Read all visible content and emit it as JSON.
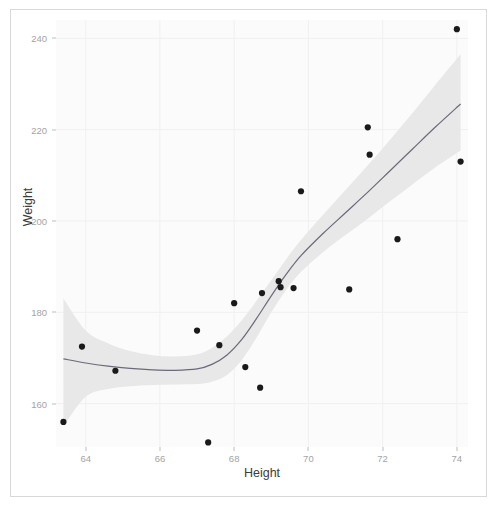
{
  "chart_data": {
    "type": "scatter",
    "title": "",
    "subtitle": "",
    "xlabel": "Height",
    "ylabel": "Weight",
    "xlim": [
      63.2,
      74.3
    ],
    "ylim": [
      150.5,
      244.0
    ],
    "xticks": [
      64,
      66,
      68,
      70,
      72,
      74
    ],
    "xticklabels": [
      "64",
      "66",
      "68",
      "70",
      "72",
      "74"
    ],
    "yticks": [
      160,
      180,
      200,
      220,
      240
    ],
    "yticklabels": [
      "160",
      "180",
      "200",
      "220",
      "240"
    ],
    "grid": true,
    "legend": false,
    "legend_position": "none",
    "points": [
      {
        "x": 63.4,
        "y": 156.0
      },
      {
        "x": 63.9,
        "y": 172.5
      },
      {
        "x": 64.8,
        "y": 167.2
      },
      {
        "x": 67.0,
        "y": 176.0
      },
      {
        "x": 67.3,
        "y": 151.5
      },
      {
        "x": 67.6,
        "y": 172.8
      },
      {
        "x": 68.0,
        "y": 182.0
      },
      {
        "x": 68.3,
        "y": 168.0
      },
      {
        "x": 68.7,
        "y": 163.5
      },
      {
        "x": 68.75,
        "y": 184.2
      },
      {
        "x": 69.2,
        "y": 186.8
      },
      {
        "x": 69.25,
        "y": 185.5
      },
      {
        "x": 69.6,
        "y": 185.3
      },
      {
        "x": 69.8,
        "y": 206.5
      },
      {
        "x": 71.1,
        "y": 185.0
      },
      {
        "x": 71.6,
        "y": 220.5
      },
      {
        "x": 71.65,
        "y": 214.5
      },
      {
        "x": 72.4,
        "y": 196.0
      },
      {
        "x": 74.0,
        "y": 242.0
      },
      {
        "x": 74.1,
        "y": 213.0
      }
    ],
    "smooth_line": {
      "name": "loess",
      "color": "#6a6a7a",
      "points": [
        {
          "x": 63.4,
          "y": 169.8
        },
        {
          "x": 64.0,
          "y": 168.9
        },
        {
          "x": 64.6,
          "y": 168.2
        },
        {
          "x": 65.2,
          "y": 167.7
        },
        {
          "x": 65.8,
          "y": 167.4
        },
        {
          "x": 66.4,
          "y": 167.3
        },
        {
          "x": 67.0,
          "y": 167.6
        },
        {
          "x": 67.4,
          "y": 168.6
        },
        {
          "x": 67.8,
          "y": 170.6
        },
        {
          "x": 68.2,
          "y": 174.0
        },
        {
          "x": 68.6,
          "y": 178.6
        },
        {
          "x": 69.0,
          "y": 183.6
        },
        {
          "x": 69.4,
          "y": 188.3
        },
        {
          "x": 69.8,
          "y": 192.4
        },
        {
          "x": 70.4,
          "y": 197.3
        },
        {
          "x": 71.0,
          "y": 201.8
        },
        {
          "x": 71.6,
          "y": 206.3
        },
        {
          "x": 72.2,
          "y": 211.0
        },
        {
          "x": 72.8,
          "y": 215.7
        },
        {
          "x": 73.4,
          "y": 220.4
        },
        {
          "x": 74.1,
          "y": 225.6
        }
      ]
    },
    "confidence_band": {
      "fill": "#e8e8e8",
      "level": 0.95,
      "upper": [
        {
          "x": 63.4,
          "y": 183.0
        },
        {
          "x": 64.0,
          "y": 176.0
        },
        {
          "x": 64.6,
          "y": 173.2
        },
        {
          "x": 65.2,
          "y": 171.5
        },
        {
          "x": 65.8,
          "y": 170.6
        },
        {
          "x": 66.4,
          "y": 170.3
        },
        {
          "x": 67.0,
          "y": 170.8
        },
        {
          "x": 67.4,
          "y": 172.2
        },
        {
          "x": 67.8,
          "y": 174.7
        },
        {
          "x": 68.2,
          "y": 178.2
        },
        {
          "x": 68.6,
          "y": 182.5
        },
        {
          "x": 69.0,
          "y": 187.0
        },
        {
          "x": 69.4,
          "y": 191.6
        },
        {
          "x": 69.8,
          "y": 195.8
        },
        {
          "x": 70.4,
          "y": 201.4
        },
        {
          "x": 71.0,
          "y": 206.8
        },
        {
          "x": 71.6,
          "y": 212.2
        },
        {
          "x": 72.2,
          "y": 217.8
        },
        {
          "x": 72.8,
          "y": 223.6
        },
        {
          "x": 73.4,
          "y": 229.6
        },
        {
          "x": 74.1,
          "y": 236.5
        }
      ],
      "lower": [
        {
          "x": 63.4,
          "y": 155.0
        },
        {
          "x": 64.0,
          "y": 161.5
        },
        {
          "x": 64.6,
          "y": 163.2
        },
        {
          "x": 65.2,
          "y": 163.8
        },
        {
          "x": 65.8,
          "y": 164.1
        },
        {
          "x": 66.4,
          "y": 164.2
        },
        {
          "x": 67.0,
          "y": 164.3
        },
        {
          "x": 67.4,
          "y": 164.8
        },
        {
          "x": 67.8,
          "y": 166.2
        },
        {
          "x": 68.2,
          "y": 169.5
        },
        {
          "x": 68.6,
          "y": 174.4
        },
        {
          "x": 69.0,
          "y": 180.0
        },
        {
          "x": 69.4,
          "y": 184.9
        },
        {
          "x": 69.8,
          "y": 188.8
        },
        {
          "x": 70.4,
          "y": 193.2
        },
        {
          "x": 71.0,
          "y": 196.9
        },
        {
          "x": 71.6,
          "y": 200.5
        },
        {
          "x": 72.2,
          "y": 204.3
        },
        {
          "x": 72.8,
          "y": 208.0
        },
        {
          "x": 73.4,
          "y": 211.6
        },
        {
          "x": 74.1,
          "y": 215.4
        }
      ]
    }
  },
  "style": {
    "panel_background": "#fbfbfb",
    "grid_color": "#f0f0f0",
    "tick_label_color": "#a3a3a3",
    "axis_title_color": "#3c3c3c",
    "point_color": "#1a1a1a",
    "line_color": "#6a6a7a",
    "band_color": "#e8e8e8",
    "figure_border": "#d8d8d8"
  }
}
